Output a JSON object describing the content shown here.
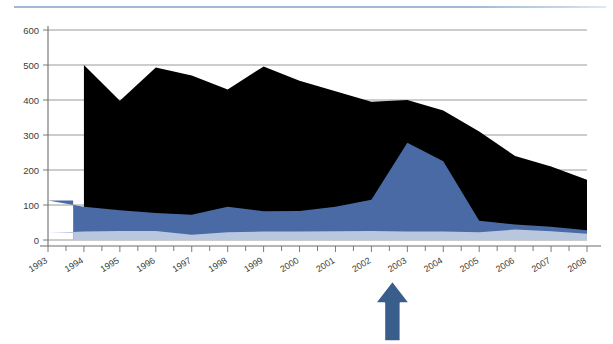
{
  "figure": {
    "background_color": "#ffffff",
    "top_rule_color": "#9fb9d4",
    "width": 613,
    "height": 344
  },
  "annotation": {
    "arrow": {
      "name": "up-arrow-annotation",
      "color": "#3a5e8c",
      "outline_color": "#ffffff",
      "points_at_year": "2002",
      "direction": "up"
    }
  },
  "chart_data": {
    "type": "area",
    "stacked": true,
    "title": "",
    "subtitle": "",
    "xlabel": "",
    "ylabel": "",
    "categories": [
      "1993",
      "1994",
      "1995",
      "1996",
      "1997",
      "1998",
      "1999",
      "2000",
      "2001",
      "2002",
      "2003",
      "2004",
      "2005",
      "2006",
      "2007",
      "2008"
    ],
    "x": [
      1993,
      1994,
      1995,
      1996,
      1997,
      1998,
      1999,
      2000,
      2001,
      2002,
      2003,
      2004,
      2005,
      2006,
      2007,
      2008
    ],
    "ylim": [
      0,
      600
    ],
    "xlim": [
      1993,
      2008
    ],
    "yticks": [
      0,
      100,
      200,
      300,
      400,
      500,
      600
    ],
    "ytick_labels": [
      "0",
      "100",
      "200",
      "300",
      "400",
      "500",
      "600"
    ],
    "xtick_labels": [
      "1993",
      "1994",
      "1995",
      "1996",
      "1997",
      "1998",
      "1999",
      "2000",
      "2001",
      "2002",
      "2003",
      "2004",
      "2005",
      "2006",
      "2007",
      "2008"
    ],
    "xtick_label_rotation_deg": -32,
    "grid": true,
    "grid_axis": "y",
    "legend": false,
    "legend_position": "none",
    "data_start_year": 1993.7,
    "series": [
      {
        "name": "series-bottom",
        "color": "#b9c7de",
        "stack_order": 1,
        "values": [
          20,
          24,
          26,
          26,
          15,
          22,
          24,
          24,
          25,
          26,
          24,
          24,
          22,
          30,
          25,
          18
        ]
      },
      {
        "name": "series-middle",
        "color": "#4a6aa5",
        "stack_order": 2,
        "values": [
          93,
          71,
          59,
          51,
          57,
          73,
          58,
          59,
          70,
          89,
          254,
          201,
          33,
          14,
          13,
          10
        ]
      },
      {
        "name": "series-top",
        "color": "#000000",
        "stack_order": 3,
        "values": [
          0,
          405,
          313,
          416,
          398,
          335,
          414,
          372,
          330,
          280,
          122,
          145,
          255,
          196,
          172,
          144
        ]
      }
    ],
    "cumulative_totals": {
      "series-bottom": [
        20,
        24,
        26,
        26,
        15,
        22,
        24,
        24,
        25,
        26,
        24,
        24,
        22,
        30,
        25,
        18
      ],
      "series-middle": [
        113,
        95,
        85,
        77,
        72,
        95,
        82,
        83,
        95,
        115,
        278,
        225,
        55,
        44,
        38,
        28
      ],
      "series-top": [
        113,
        500,
        398,
        493,
        470,
        430,
        496,
        455,
        425,
        395,
        400,
        370,
        310,
        240,
        210,
        172
      ]
    }
  }
}
